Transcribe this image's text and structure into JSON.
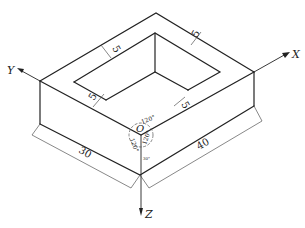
{
  "diagram": {
    "type": "isometric-projection",
    "axes": {
      "x": {
        "label": "X"
      },
      "y": {
        "label": "Y"
      },
      "z": {
        "label": "Z"
      },
      "origin": {
        "label": "O"
      }
    },
    "angles": {
      "top": "120°",
      "left": "120°",
      "right": "120°"
    },
    "dimensions": {
      "length_left": "30",
      "length_right": "40",
      "wall_top_left": "5",
      "wall_top_right": "5",
      "wall_bottom_left": "5",
      "wall_bottom_right": "5"
    }
  }
}
